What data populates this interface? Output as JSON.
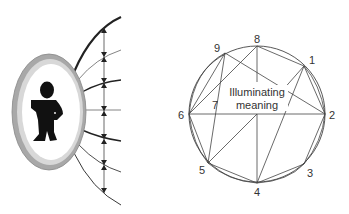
{
  "left_figure": {
    "description": "Person inside an oval mirror/lens with field lines radiating outward and a vertical line with arrowheads",
    "colors": {
      "ring": "#b8b8b8",
      "figure": "#111111",
      "lines": "#333333"
    }
  },
  "right_figure": {
    "center_label_line1": "Illuminating",
    "center_label_line2": "meaning",
    "points": [
      {
        "id": "1",
        "label": "1"
      },
      {
        "id": "2",
        "label": "2"
      },
      {
        "id": "3",
        "label": "3"
      },
      {
        "id": "4",
        "label": "4"
      },
      {
        "id": "5",
        "label": "5"
      },
      {
        "id": "6",
        "label": "6"
      },
      {
        "id": "7",
        "label": "7"
      },
      {
        "id": "8",
        "label": "8"
      },
      {
        "id": "9",
        "label": "9"
      }
    ]
  }
}
